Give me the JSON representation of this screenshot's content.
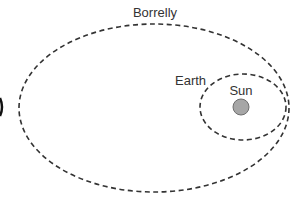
{
  "diagram": {
    "labels": {
      "borrelly": "Borrelly",
      "earth": "Earth",
      "sun": "Sun"
    },
    "colors": {
      "orbit_stroke": "#333333",
      "sun_fill": "#a6a6a6",
      "sun_stroke": "#6e6e6e",
      "text": "#333333",
      "background": "#ffffff"
    },
    "elements": [
      {
        "name": "borrelly-orbit",
        "shape": "dashed-ellipse",
        "cx": 154,
        "cy": 108,
        "rx": 135,
        "ry": 84
      },
      {
        "name": "earth-orbit",
        "shape": "dashed-ellipse",
        "cx": 243,
        "cy": 107,
        "rx": 43,
        "ry": 33
      },
      {
        "name": "sun",
        "shape": "circle",
        "cx": 241,
        "cy": 107,
        "r": 8
      }
    ]
  }
}
